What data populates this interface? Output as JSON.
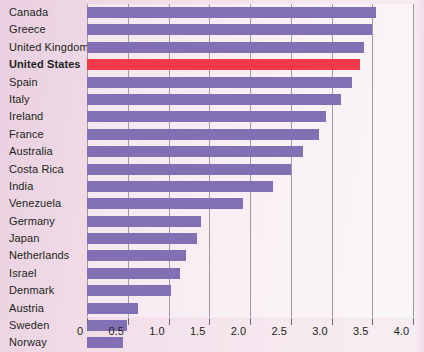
{
  "chart_data": {
    "type": "bar",
    "orientation": "horizontal",
    "title": "",
    "subtitle": "",
    "xlabel": "",
    "ylabel": "",
    "xlim": [
      0,
      4.0
    ],
    "grid": true,
    "legend": "none",
    "xticks": [
      "0",
      "0.5",
      "1.0",
      "1.5",
      "2.0",
      "2.5",
      "3.0",
      "3.5",
      "4.0"
    ],
    "xtick_values": [
      0,
      0.5,
      1.0,
      1.5,
      2.0,
      2.5,
      3.0,
      3.5,
      4.0
    ],
    "categories": [
      "Canada",
      "Greece",
      "United Kingdom",
      "United States",
      "Spain",
      "Italy",
      "Ireland",
      "France",
      "Australia",
      "Costa Rica",
      "India",
      "Venezuela",
      "Germany",
      "Japan",
      "Netherlands",
      "Israel",
      "Denmark",
      "Austria",
      "Sweden",
      "Norway"
    ],
    "values": [
      3.55,
      3.5,
      3.4,
      3.35,
      3.25,
      3.12,
      2.93,
      2.85,
      2.65,
      2.5,
      2.28,
      1.92,
      1.4,
      1.35,
      1.22,
      1.14,
      1.03,
      0.62,
      0.49,
      0.44
    ],
    "highlight_category": "United States",
    "colors": {
      "bar": "#8171b4",
      "highlight_bar": "#f3394a",
      "background": "#efd9e6",
      "plot_background": "#f8eff4",
      "gridline": "#9e9aa0",
      "text": "#231f20"
    }
  }
}
